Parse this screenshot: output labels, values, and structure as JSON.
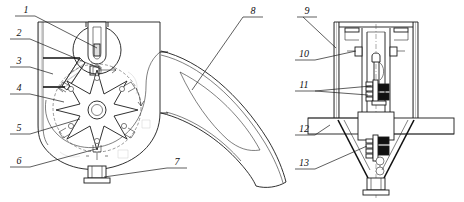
{
  "figure": {
    "title": "",
    "type": "technical-patent-line-drawing",
    "line_color": "#1a1a1a",
    "background_color": "#ffffff"
  },
  "callouts": {
    "left_assembly": [
      {
        "id": "1",
        "text": "1",
        "label_x": 26,
        "label_y": 13
      },
      {
        "id": "2",
        "text": "2",
        "label_x": 19,
        "label_y": 36
      },
      {
        "id": "3",
        "text": "3",
        "label_x": 19,
        "label_y": 64
      },
      {
        "id": "4",
        "text": "4",
        "label_x": 19,
        "label_y": 91
      },
      {
        "id": "5",
        "text": "5",
        "label_x": 19,
        "label_y": 131
      },
      {
        "id": "6",
        "text": "6",
        "label_x": 19,
        "label_y": 164
      },
      {
        "id": "7",
        "text": "7",
        "label_x": 176,
        "label_y": 165
      },
      {
        "id": "8",
        "text": "8",
        "label_x": 252,
        "label_y": 14
      }
    ],
    "right_assembly": [
      {
        "id": "9",
        "text": "9",
        "label_x": 306,
        "label_y": 14
      },
      {
        "id": "10",
        "text": "10",
        "label_x": 303,
        "label_y": 57
      },
      {
        "id": "11",
        "text": "11",
        "label_x": 303,
        "label_y": 88
      },
      {
        "id": "12",
        "text": "12",
        "label_x": 303,
        "label_y": 132
      },
      {
        "id": "13",
        "text": "13",
        "label_x": 303,
        "label_y": 166
      }
    ]
  },
  "parts": {
    "left": {
      "casing": "volute-casing",
      "inlet": "top-cylindrical-inlet",
      "chute": "inclined-hatched-feed-chute",
      "rotor": "six-arm-impeller-rotor",
      "hub": "central-hub",
      "bottom_port": "bottom-flange-outlet",
      "rotor_arms": 6
    },
    "center": {
      "duct": "curved-transition-duct"
    },
    "right": {
      "shell": "vertical-separator-shell",
      "internal_column": "internal-riser-column",
      "shaft_assembly": "central-shaft-with-bearings",
      "support_plate": "horizontal-support-plate",
      "hopper": "conical-hopper",
      "bottom_flange": "hopper-discharge-flange"
    }
  }
}
